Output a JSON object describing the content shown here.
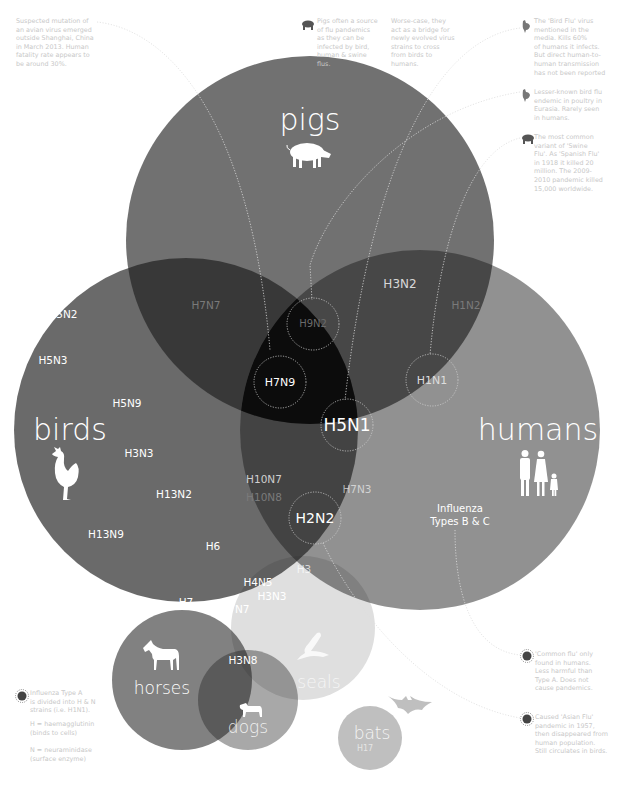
{
  "colors": {
    "background": "#ffffff",
    "circle_fill": "#1a1a1a",
    "label_white": "#ffffff",
    "label_dim": "#7a7a7a",
    "note_text": "#c8c8c8",
    "leader_line": "#dddddd"
  },
  "hosts": {
    "pigs": {
      "label": "pigs",
      "icon": "pig-icon"
    },
    "birds": {
      "label": "birds",
      "icon": "rooster-icon"
    },
    "humans": {
      "label": "humans",
      "icon": "family-icon",
      "sublabel_1": "Influenza",
      "sublabel_2": "Types B & C"
    },
    "horses": {
      "label": "horses",
      "icon": "horse-icon"
    },
    "seals": {
      "label": "seals",
      "icon": "seal-icon"
    },
    "dogs": {
      "label": "dogs",
      "icon": "dog-icon"
    },
    "bats": {
      "label": "bats",
      "icon": "bat-icon",
      "strain": "H17"
    }
  },
  "strains": {
    "birds_only": [
      "H5N2",
      "H5N3",
      "H5N9",
      "H3N3",
      "H13N2",
      "H13N9",
      "H6"
    ],
    "birds_pigs": [
      "H7N7"
    ],
    "pigs_humans": [
      "H3N2",
      "H1N2"
    ],
    "birds_humans": [
      "H10N7",
      "H10N8",
      "H7N3",
      "H3"
    ],
    "highlighted": {
      "h9n2": "H9N2",
      "h7n9": "H7N9",
      "h5n1": "H5N1",
      "h1n1": "H1N1",
      "h2n2": "H2N2"
    },
    "birds_horses": [
      "H7"
    ],
    "birds_horses_seals": [
      "H7N7"
    ],
    "birds_seals": [
      "H4N5",
      "H3N3"
    ],
    "horses_dogs": [
      "H3N8"
    ]
  },
  "notes": {
    "h7n9": "Suspected mutation of\nan avian virus emerged\noutside Shanghai, China\nin March 2013. Human\nfatality rate appears to\nbe around 30%.",
    "pigs_source": "Pigs often a source\nof flu pandemics\nas they can be\ninfected by bird,\nhuman & swine\nflus.",
    "pigs_bridge": "Worse-case, they\nact as a bridge for\nnewly evolved virus\nstrains to cross\nfrom birds to\nhumans.",
    "h5n1": "The 'Bird Flu' virus\nmentioned in the\nmedia. Kills 60%\nof humans it infects.\nBut direct human-to-\nhuman transmission\nhas not been reported",
    "h9n2": "Lesser-known bird flu\nendemic in poultry in\nEurasia. Rarely seen\nin humans.",
    "h1n1": "The most common\nvariant of 'Swine\nFlu'. As 'Spanish Flu'\nin 1918 it killed 20\nmillion. The 2009-\n2010 pandemic killed\n15,000 worldwide.",
    "types_bc": "'Common flu' only\nfound in humans.\nLess harmful than\nType A. Does not\ncause pandemics.",
    "h2n2": "Caused 'Asian Flu'\npandemic in 1957,\nthen disappeared from\nhuman population.\nStill circulates in birds.",
    "legend": "Influenza Type A\nis divided into H & N\nstrains (i.e. H1N1).",
    "legend_h": "H = haemagglutinin\n(binds to cells)",
    "legend_n": "N = neuraminidase\n(surface enzyme)"
  }
}
